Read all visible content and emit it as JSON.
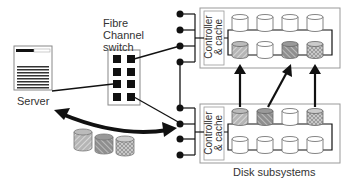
{
  "labels": {
    "server": "Server",
    "switch_line1": "Fibre",
    "switch_line2": "Channel",
    "switch_line3": "switch",
    "disk_subsystems": "Disk subsystems",
    "controller_top_line1": "Controller",
    "controller_top_line2": "& cache",
    "controller_bottom_line1": "Controller",
    "controller_bottom_line2": "& cache"
  },
  "colors": {
    "line": "#111111",
    "box_border": "#999999",
    "disk_fill": "#ffffff",
    "pattern_fill": "#9a9a9a",
    "text": "#333333"
  },
  "diagram": {
    "nodes": [
      {
        "id": "server",
        "label": "Server"
      },
      {
        "id": "switch",
        "label": "Fibre Channel switch",
        "ports": 8
      },
      {
        "id": "subsystem-top",
        "label": "Controller & cache",
        "disks": 8,
        "patterned_disks": [
          4,
          6,
          7
        ]
      },
      {
        "id": "subsystem-bottom",
        "label": "Controller & cache",
        "disks": 8,
        "patterned_disks": [
          0,
          1,
          3
        ]
      }
    ],
    "edges": [
      {
        "from": "server",
        "to": "switch"
      },
      {
        "from": "switch",
        "to": "subsystem-top"
      },
      {
        "from": "switch",
        "to": "subsystem-bottom"
      },
      {
        "from": "subsystem-top",
        "to": "subsystem-bottom"
      },
      {
        "from": "server",
        "to": "subsystem-bottom",
        "type": "double-arrow",
        "carrying": "3 disk volumes"
      },
      {
        "from": "subsystem-bottom",
        "to": "subsystem-top",
        "type": "arrow",
        "count": 3
      }
    ]
  }
}
